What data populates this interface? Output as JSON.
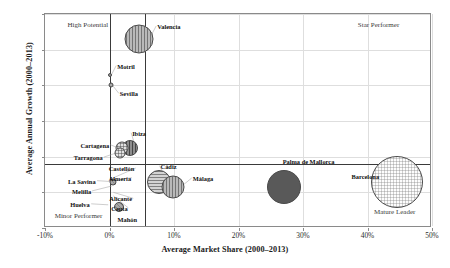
{
  "chart_data": {
    "type": "scatter",
    "title": "",
    "xlabel": "Average Market Share (2000–2013)",
    "ylabel": "Average Annual Growth (2000–2013)",
    "xlim": [
      -10,
      50
    ],
    "ylim": [
      0,
      60
    ],
    "xticks": [
      "-10%",
      "0%",
      "10%",
      "20%",
      "30%",
      "40%",
      "50%"
    ],
    "xtick_values": [
      -10,
      0,
      10,
      20,
      30,
      40,
      50
    ],
    "yticks": [
      "0%",
      "10%",
      "20%",
      "30%",
      "40%",
      "50%",
      "60%"
    ],
    "ytick_values": [
      0,
      10,
      20,
      30,
      40,
      50,
      60
    ],
    "grid": true,
    "legend": "none",
    "reference_lines": {
      "vertical": [
        0,
        5.5
      ],
      "horizontal": [
        18
      ]
    },
    "quadrant_notes": [
      {
        "label": "High Potential",
        "x": -6.5,
        "y": 57
      },
      {
        "label": "Star Performer",
        "x": 38.5,
        "y": 57
      },
      {
        "label": "Mature Leader",
        "x": 41.0,
        "y": 4.5
      },
      {
        "label": "Minor Performer",
        "x": -8.5,
        "y": 3.5
      }
    ],
    "points": [
      {
        "name": "Valencia",
        "x": 4.6,
        "y": 53.0,
        "size": 29,
        "pattern": "pat-vert",
        "label_dx": 18,
        "label_dy": -12,
        "leader": true
      },
      {
        "name": "Motril",
        "x": 0.1,
        "y": 43.0,
        "size": 4,
        "pattern": "pat-mid",
        "label_dx": 7,
        "label_dy": -8,
        "leader": true
      },
      {
        "name": "Sevilla",
        "x": 0.2,
        "y": 40.0,
        "size": 5,
        "pattern": "pat-gray",
        "label_dx": 9,
        "label_dy": 9,
        "leader": true
      },
      {
        "name": "Ibiza",
        "x": 3.2,
        "y": 22.5,
        "size": 16,
        "pattern": "pat-vert-dark",
        "label_dx": 2,
        "label_dy": -14,
        "leader": true
      },
      {
        "name": "Cartagena",
        "x": 2.0,
        "y": 22.5,
        "size": 13,
        "pattern": "pat-cross",
        "label_dx": -42,
        "label_dy": -2,
        "leader": true
      },
      {
        "name": "Tarragona",
        "x": 1.6,
        "y": 21.0,
        "size": 11,
        "pattern": "pat-cross",
        "label_dx": -46,
        "label_dy": 5,
        "leader": true
      },
      {
        "name": "Castellón",
        "x": 0.5,
        "y": 14.0,
        "size": 0,
        "pattern": "none",
        "label_dx": -4,
        "label_dy": -9,
        "leader": true
      },
      {
        "name": "Almería",
        "x": 0.5,
        "y": 13.0,
        "size": 7,
        "pattern": "pat-gray",
        "label_dx": -4,
        "label_dy": -3,
        "leader": true
      },
      {
        "name": "La Savina",
        "x": 0.4,
        "y": 13.0,
        "size": 0,
        "pattern": "none",
        "label_dx": -44,
        "label_dy": 0,
        "leader": true
      },
      {
        "name": "Melilla",
        "x": 0.4,
        "y": 11.8,
        "size": 0,
        "pattern": "none",
        "label_dx": -40,
        "label_dy": 6,
        "leader": true
      },
      {
        "name": "Alicante",
        "x": 0.6,
        "y": 10.0,
        "size": 0,
        "pattern": "none",
        "label_dx": -4,
        "label_dy": 7,
        "leader": true
      },
      {
        "name": "Ceuta",
        "x": 0.6,
        "y": 9.0,
        "size": 0,
        "pattern": "none",
        "label_dx": -2,
        "label_dy": 13,
        "leader": true
      },
      {
        "name": "Huelva",
        "x": -0.2,
        "y": 6.5,
        "size": 0,
        "pattern": "none",
        "label_dx": -38,
        "label_dy": 0,
        "leader": true
      },
      {
        "name": "Mahón",
        "x": 1.4,
        "y": 6.0,
        "size": 10,
        "pattern": "pat-gray",
        "label_dx": -1,
        "label_dy": 13,
        "leader": false
      },
      {
        "name": "Cádiz",
        "x": 7.6,
        "y": 13.0,
        "size": 24,
        "pattern": "pat-horz",
        "label_dx": 2,
        "label_dy": -15,
        "leader": true
      },
      {
        "name": "Málaga",
        "x": 9.8,
        "y": 11.5,
        "size": 23,
        "pattern": "pat-vert",
        "label_dx": 20,
        "label_dy": -8,
        "leader": true
      },
      {
        "name": "Palma de Mallorca",
        "x": 27.0,
        "y": 11.5,
        "size": 34,
        "pattern": "pat-solid-dark",
        "label_dx": -1,
        "label_dy": -25,
        "leader": false
      },
      {
        "name": "Barcelona",
        "x": 44.5,
        "y": 13.0,
        "size": 52,
        "pattern": "pat-dot-light",
        "label_dx": -45,
        "label_dy": -5,
        "leader": true
      }
    ]
  }
}
